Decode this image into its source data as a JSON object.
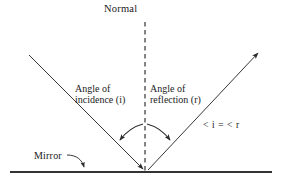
{
  "diagram": {
    "title_text": "Normal",
    "background_color": "#ffffff",
    "stroke_color": "#2b2b2b",
    "mirror_color": "#333333",
    "labels": {
      "normal": "Normal",
      "angle_of_incidence_line1": "Angle of",
      "angle_of_incidence_line2": "incidence (i)",
      "angle_of_reflection_line1": "Angle of",
      "angle_of_reflection_line2": "reflection (r)",
      "equation": "< i = < r",
      "mirror": "Mirror"
    },
    "elements": {
      "normal_line": "vertical-dashed-line",
      "incident_ray": "incoming-ray-arrow",
      "reflected_ray": "outgoing-ray-arrow",
      "mirror_surface": "horizontal-solid-line",
      "angle_arc_incidence": "curved-arrow-arc",
      "angle_arc_reflection": "curved-arrow-arc",
      "mirror_leader": "curved-leader-arrow"
    }
  }
}
